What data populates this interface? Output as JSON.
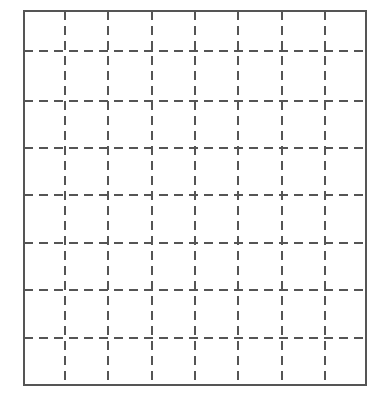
{
  "figure": {
    "title": "",
    "caption": "",
    "type": "grid-diagram",
    "background_color": "#ffffff",
    "width": 388,
    "height": 395
  },
  "chart_data": {
    "type": "table",
    "title": "",
    "subtitle": "",
    "xlabel": "",
    "ylabel": "",
    "grid": true,
    "legend": false,
    "annotations": [],
    "categories": [],
    "values": [],
    "columns": 8,
    "rows": 8,
    "cells_total": 64
  },
  "grid": {
    "columns": 8,
    "rows": 8,
    "border": {
      "x": 24,
      "y": 11,
      "width": 342,
      "height": 374,
      "stroke_color": "#555555",
      "stroke_width": 1.6,
      "style": "solid"
    },
    "interior": {
      "stroke_color": "#555555",
      "stroke_width": 1.5,
      "style": "dashed",
      "dash_on": 9,
      "dash_off": 6
    },
    "vertical_line_positions": [
      65,
      108,
      152,
      195,
      238,
      282,
      325
    ],
    "horizontal_line_positions": [
      51,
      101,
      148,
      195,
      243,
      290,
      338
    ]
  }
}
